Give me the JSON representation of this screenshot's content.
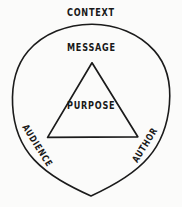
{
  "diagram": {
    "name": "rhetorical-triangle",
    "background_color": "#fbfbfa",
    "ink_color": "#1b1b1b",
    "style": "hand-drawn sketch",
    "outer_shape": {
      "type": "circle",
      "label": "CONTEXT"
    },
    "inner_shape": {
      "type": "triangle",
      "label": "PURPOSE"
    },
    "labels": {
      "context": "CONTEXT",
      "message": "MESSAGE",
      "purpose": "PURPOSE",
      "audience": "AUDIENCE",
      "author": "AUTHOR"
    }
  }
}
